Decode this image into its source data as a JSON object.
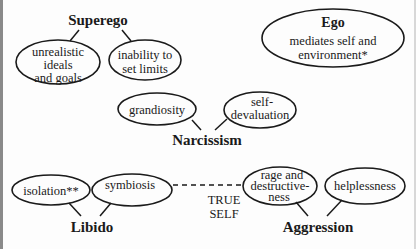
{
  "diagram": {
    "groups": {
      "superego": {
        "label": "Superego",
        "nodes": [
          {
            "lines": [
              "unrealistic",
              "ideals",
              "and goals"
            ]
          },
          {
            "lines": [
              "inability to",
              "set limits"
            ]
          }
        ]
      },
      "ego": {
        "label": "Ego",
        "lines": [
          "mediates self and",
          "environment*"
        ]
      },
      "narcissism": {
        "label": "Narcissism",
        "nodes": [
          {
            "lines": [
              "grandiosity"
            ]
          },
          {
            "lines": [
              "self-",
              "devaluation"
            ]
          }
        ]
      },
      "libido": {
        "label": "Libido",
        "nodes": [
          {
            "lines": [
              "isolation**"
            ]
          },
          {
            "lines": [
              "symbiosis"
            ]
          }
        ]
      },
      "aggression": {
        "label": "Aggression",
        "nodes": [
          {
            "lines": [
              "rage and",
              "destructive-",
              "ness"
            ]
          },
          {
            "lines": [
              "helplessness"
            ]
          }
        ]
      }
    },
    "center": {
      "lines": [
        "TRUE",
        "SELF"
      ],
      "connector": "dashed line between symbiosis and rage and destructiveness"
    },
    "colors": {
      "stroke": "#1a1a1a",
      "background": "#fdfdfd",
      "frame": "#8a8a8a"
    }
  }
}
